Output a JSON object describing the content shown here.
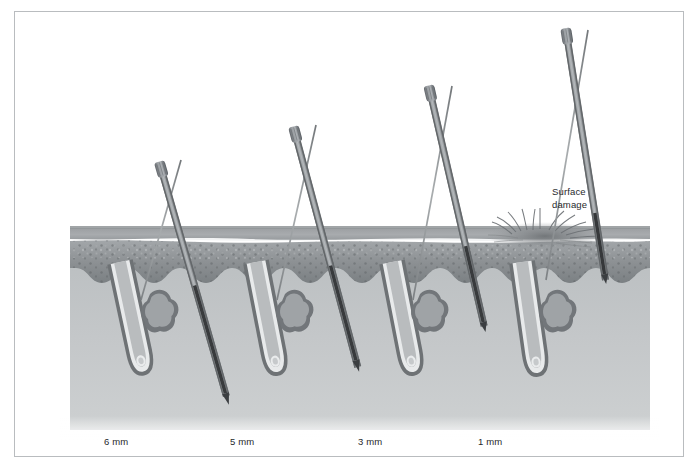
{
  "figure": {
    "background_color": "#ffffff",
    "frame_color": "#b9bcbf",
    "width": 699,
    "height": 469
  },
  "annotations": {
    "surface_damage": {
      "line1": "Surface",
      "line2": "damage",
      "x": 552,
      "y": 186
    }
  },
  "depth_labels": [
    {
      "text": "6 mm",
      "x": 104,
      "y": 436
    },
    {
      "text": "5 mm",
      "x": 230,
      "y": 436
    },
    {
      "text": "3 mm",
      "x": 358,
      "y": 436
    },
    {
      "text": "1 mm",
      "x": 478,
      "y": 436
    }
  ],
  "tissue": {
    "epidermis_top_y": 232,
    "epidermis_bottom_y": 283,
    "dermis_bottom_y": 425,
    "left_x": 85,
    "right_x": 618,
    "stratum_corneum_color": "#9a9ea1",
    "epidermis_color": "#8e9295",
    "basal_layer_color": "#6f7477",
    "dermis_color": "#c2c5c7"
  },
  "units": [
    {
      "depth_label": "6 mm",
      "needle_cap_x": 163,
      "needle_cap_y": 163,
      "follicle_x": 120,
      "needle_tip_depth": "bulb",
      "has_surface_damage": false
    },
    {
      "depth_label": "5 mm",
      "needle_cap_x": 297,
      "needle_cap_y": 128,
      "follicle_x": 256,
      "needle_tip_depth": "deep-shaft",
      "has_surface_damage": false
    },
    {
      "depth_label": "3 mm",
      "needle_cap_x": 432,
      "needle_cap_y": 87,
      "follicle_x": 392,
      "needle_tip_depth": "mid-shaft",
      "has_surface_damage": false
    },
    {
      "depth_label": "1 mm",
      "needle_cap_x": 568,
      "needle_cap_y": 30,
      "follicle_x": 522,
      "needle_tip_depth": "epidermis",
      "has_surface_damage": true
    }
  ]
}
